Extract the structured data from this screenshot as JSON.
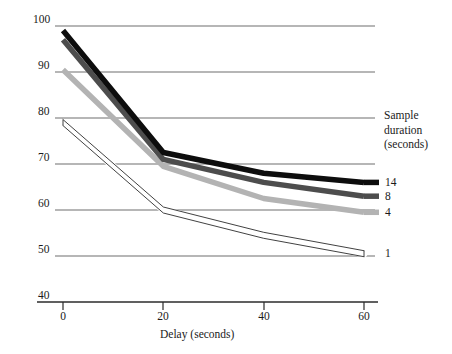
{
  "chart_data": {
    "type": "line",
    "title": "",
    "xlabel": "Delay (seconds)",
    "ylabel": "Percentage correct",
    "x": [
      0,
      20,
      40,
      60
    ],
    "xticks": [
      "0",
      "20",
      "40",
      "60"
    ],
    "yticks": [
      "40",
      "50",
      "60",
      "70",
      "80",
      "90",
      "100"
    ],
    "xlim": [
      0,
      60
    ],
    "ylim": [
      40,
      100
    ],
    "grid": "horizontal",
    "legend_position": "right",
    "legend_title": "Sample duration (seconds)",
    "series": [
      {
        "name": "14",
        "color": "#0d0d0d",
        "values": [
          99,
          72.5,
          68,
          66
        ]
      },
      {
        "name": "8",
        "color": "#4d4d4d",
        "values": [
          97,
          71,
          66,
          63
        ]
      },
      {
        "name": "4",
        "color": "#b3b3b3",
        "values": [
          90.5,
          69.5,
          62.5,
          59.5
        ]
      },
      {
        "name": "1",
        "color": "#ffffff",
        "values": [
          79,
          60,
          54.5,
          50.5
        ]
      }
    ]
  },
  "axes": {
    "y_label": "Percentage correct",
    "x_label": "Delay (seconds)",
    "y_tick_100": "100",
    "y_tick_90": "90",
    "y_tick_80": "80",
    "y_tick_70": "70",
    "y_tick_60": "60",
    "y_tick_50": "50",
    "y_tick_40": "40",
    "x_tick_0": "0",
    "x_tick_20": "20",
    "x_tick_40": "40",
    "x_tick_60": "60"
  },
  "legend": {
    "title_line1": "Sample",
    "title_line2": "duration",
    "title_line3": "(seconds)",
    "key_14": "14",
    "key_8": "8",
    "key_4": "4",
    "key_1": "1"
  },
  "colors": {
    "series_14": "#0d0d0d",
    "series_8": "#4d4d4d",
    "series_4": "#b3b3b3",
    "series_1": "#ffffff",
    "gridline": "#6e6e6e",
    "axis": "#2b2b2b"
  }
}
